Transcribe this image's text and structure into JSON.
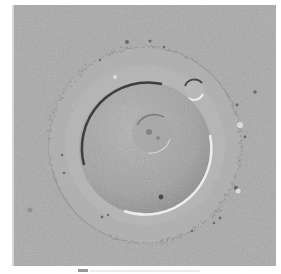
{
  "image": {
    "description": "Differential interference contrast micrograph of a single oocyte with surrounding zona pellucida and a polar body",
    "alt": "Oocyte micrograph"
  },
  "colors": {
    "background": "#a9a9a9",
    "zona": "#b4b4b4",
    "cytoplasm": "#a2a2a2",
    "highlight": "#e6e6e6",
    "shadow": "#4a4a4a"
  },
  "caption": {
    "text": ""
  }
}
